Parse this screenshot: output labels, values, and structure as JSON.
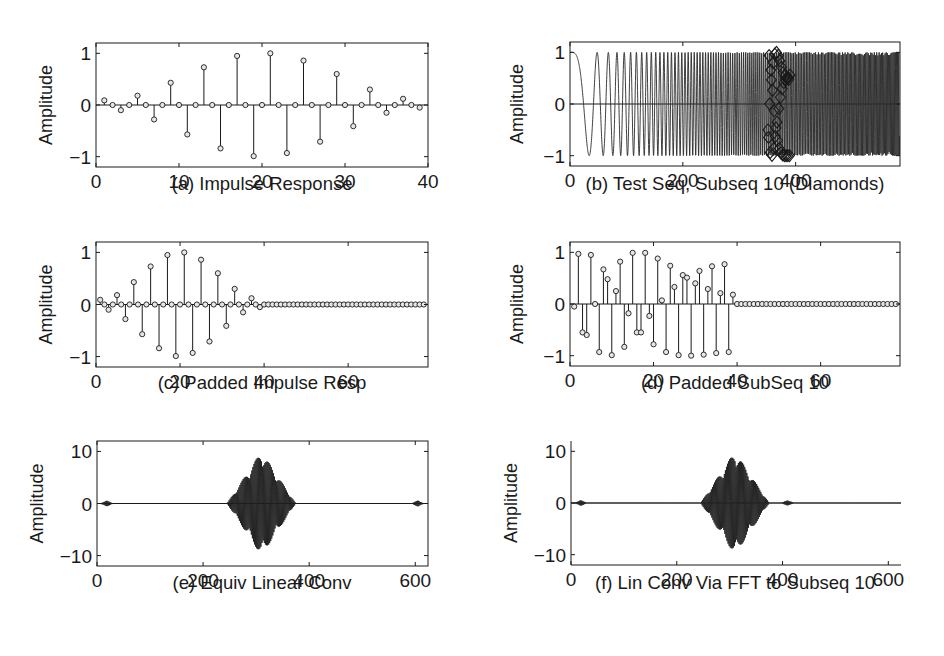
{
  "figure": {
    "background": "#ffffff",
    "ink_color": "#1a1a1a"
  },
  "panels": [
    {
      "id": "a",
      "caption": "(a) Impulse Response",
      "ylabel": "Amplitude"
    },
    {
      "id": "b",
      "caption": "(b) Test Seq, Subseq 10 (Diamonds)",
      "ylabel": "Amplitude"
    },
    {
      "id": "c",
      "caption": "(c) Padded Impulse Resp",
      "ylabel": "Amplitude"
    },
    {
      "id": "d",
      "caption": "(d) Padded SubSeq 10",
      "ylabel": "Amplitude"
    },
    {
      "id": "e",
      "caption": "(e) Equiv Linear Conv",
      "ylabel": "Amplitude"
    },
    {
      "id": "f",
      "caption": "(f) Lin Conv Via FFT to Subseq 10",
      "ylabel": "Amplitude"
    }
  ],
  "chart_data": [
    {
      "id": "a",
      "type": "stem",
      "title": "(a) Impulse Response",
      "xlabel": "",
      "ylabel": "Amplitude",
      "xlim": [
        0,
        40
      ],
      "ylim": [
        -1.2,
        1.2
      ],
      "xticks": [
        0,
        10,
        20,
        30,
        40
      ],
      "yticks": [
        -1,
        0,
        1
      ],
      "ytick_labels": [
        "−1",
        "0",
        "1"
      ],
      "box": true,
      "x": [
        1,
        2,
        3,
        4,
        5,
        6,
        7,
        8,
        9,
        10,
        11,
        12,
        13,
        14,
        15,
        16,
        17,
        18,
        19,
        20,
        21,
        22,
        23,
        24,
        25,
        26,
        27,
        28,
        29,
        30,
        31,
        32,
        33,
        34,
        35,
        36,
        37,
        38,
        39
      ],
      "values": [
        0.09,
        0,
        -0.1,
        0,
        0.18,
        0,
        -0.28,
        0,
        0.43,
        0,
        -0.57,
        0,
        0.73,
        0,
        -0.84,
        0,
        0.95,
        0,
        -0.99,
        0,
        1.0,
        0,
        -0.93,
        0,
        0.86,
        0,
        -0.71,
        0,
        0.6,
        0,
        -0.41,
        0,
        0.3,
        0,
        -0.15,
        0,
        0.12,
        0,
        -0.05
      ]
    },
    {
      "id": "b",
      "type": "line",
      "title": "(b) Test Seq, Subseq 10 (Diamonds)",
      "xlabel": "",
      "ylabel": "Amplitude",
      "xlim": [
        0,
        585
      ],
      "ylim": [
        -1.2,
        1.2
      ],
      "xticks": [
        0,
        200,
        400
      ],
      "yticks": [
        -1,
        0,
        1
      ],
      "ytick_labels": [
        "−1",
        "0",
        "1"
      ],
      "box": true,
      "series": [
        {
          "name": "Test sequence (linear chirp)",
          "formula": "cos(0.00272*n^2)",
          "n_range": [
            0,
            584
          ]
        },
        {
          "name": "Subseq 10 (Diamonds)",
          "marker": "diamond",
          "n_range": [
            351,
            390
          ]
        }
      ]
    },
    {
      "id": "c",
      "type": "stem",
      "title": "(c) Padded Impulse Resp",
      "xlabel": "",
      "ylabel": "Amplitude",
      "xlim": [
        0,
        79
      ],
      "ylim": [
        -1.2,
        1.2
      ],
      "xticks": [
        0,
        20,
        40,
        60
      ],
      "yticks": [
        -1,
        0,
        1
      ],
      "ytick_labels": [
        "−1",
        "0",
        "1"
      ],
      "box": true,
      "x_range": [
        1,
        78
      ],
      "values": [
        0.09,
        0,
        -0.1,
        0,
        0.18,
        0,
        -0.28,
        0,
        0.43,
        0,
        -0.57,
        0,
        0.73,
        0,
        -0.84,
        0,
        0.95,
        0,
        -0.99,
        0,
        1.0,
        0,
        -0.93,
        0,
        0.86,
        0,
        -0.71,
        0,
        0.6,
        0,
        -0.41,
        0,
        0.3,
        0,
        -0.15,
        0,
        0.12,
        0,
        -0.05
      ],
      "pad_zeros_to": 78
    },
    {
      "id": "d",
      "type": "stem",
      "title": "(d) Padded SubSeq 10",
      "xlabel": "",
      "ylabel": "Amplitude",
      "xlim": [
        0,
        79
      ],
      "ylim": [
        -1.2,
        1.2
      ],
      "xticks": [
        0,
        20,
        40,
        60
      ],
      "yticks": [
        -1,
        0,
        1
      ],
      "ytick_labels": [
        "−1",
        "0",
        "1"
      ],
      "box": true,
      "x_range": [
        1,
        78
      ],
      "values": [
        -0.05,
        0.97,
        -0.55,
        -0.6,
        0.95,
        0,
        -0.93,
        0.67,
        0.48,
        -0.99,
        0.25,
        0.82,
        -0.83,
        -0.18,
        0.99,
        -0.55,
        -0.55,
        0.99,
        -0.23,
        -0.78,
        0.88,
        0.07,
        -0.93,
        0.74,
        0.33,
        -0.99,
        0.56,
        0.51,
        -1.0,
        0.4,
        0.64,
        -0.98,
        0.29,
        0.73,
        -0.95,
        0.21,
        0.77,
        -0.93,
        0.18
      ],
      "pad_zeros_to": 78
    },
    {
      "id": "e",
      "type": "line",
      "title": "(e) Equiv Linear Conv",
      "xlabel": "",
      "ylabel": "Amplitude",
      "xlim": [
        0,
        624
      ],
      "ylim": [
        -12,
        12
      ],
      "xticks": [
        0,
        200,
        400,
        600
      ],
      "yticks": [
        -10,
        0,
        10
      ],
      "ytick_labels": [
        "−10",
        "0",
        "10"
      ],
      "box": true,
      "bursts": [
        {
          "center": 18,
          "half_width": 12,
          "peak": 0.6
        },
        {
          "center": 310,
          "half_width": 65,
          "peak": 10
        },
        {
          "center": 605,
          "half_width": 12,
          "peak": 0.6
        }
      ]
    },
    {
      "id": "f",
      "type": "line",
      "title": "(f) Lin Conv Via FFT to Subseq 10",
      "xlabel": "",
      "ylabel": "Amplitude",
      "xlim": [
        0,
        624
      ],
      "ylim": [
        -12,
        12
      ],
      "xticks": [
        0,
        200,
        400,
        600
      ],
      "yticks": [
        -10,
        0,
        10
      ],
      "ytick_labels": [
        "−10",
        "0",
        "10"
      ],
      "box": false,
      "bursts": [
        {
          "center": 18,
          "half_width": 12,
          "peak": 0.6
        },
        {
          "center": 310,
          "half_width": 65,
          "peak": 10
        },
        {
          "center": 410,
          "half_width": 12,
          "peak": 0.6
        }
      ]
    }
  ],
  "layout": {
    "a": {
      "left": 96,
      "top": 43,
      "width": 332,
      "height": 124,
      "caption_x": 262,
      "caption_y": 173,
      "ylabel_x": 52
    },
    "b": {
      "left": 570,
      "top": 42,
      "width": 330,
      "height": 124,
      "caption_x": 735,
      "caption_y": 173,
      "ylabel_x": 523
    },
    "c": {
      "left": 96,
      "top": 242,
      "width": 332,
      "height": 125,
      "caption_x": 262,
      "caption_y": 372,
      "ylabel_x": 52
    },
    "d": {
      "left": 570,
      "top": 242,
      "width": 330,
      "height": 124,
      "caption_x": 735,
      "caption_y": 372,
      "ylabel_x": 523
    },
    "e": {
      "left": 97,
      "top": 441,
      "width": 331,
      "height": 125,
      "caption_x": 262,
      "caption_y": 572,
      "ylabel_x": 43
    },
    "f": {
      "left": 571,
      "top": 441,
      "width": 330,
      "height": 124,
      "caption_x": 735,
      "caption_y": 572,
      "ylabel_x": 517
    }
  }
}
